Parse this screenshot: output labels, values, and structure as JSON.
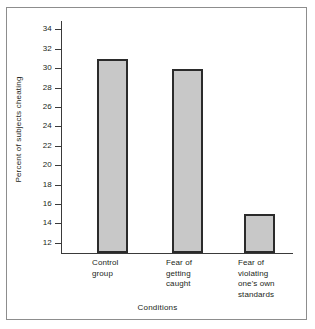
{
  "chart_data": {
    "type": "bar",
    "title": "",
    "subtitle": "",
    "xlabel": "Conditions",
    "ylabel": "Percent of subjects cheating",
    "categories": [
      "Control\ngroup",
      "Fear of\ngetting\ncaught",
      "Fear of\nviolating\none's own\nstandards"
    ],
    "values": [
      31,
      30,
      15
    ],
    "ylim": [
      11,
      34.8
    ],
    "yticks": [
      12,
      14,
      16,
      18,
      20,
      22,
      24,
      26,
      28,
      30,
      32,
      34
    ],
    "ytick_labels": [
      "12",
      "14",
      "16",
      "18",
      "20",
      "22",
      "24",
      "26",
      "28",
      "30",
      "32",
      "34"
    ],
    "grid": false,
    "legend": null,
    "bar_fill_color": "#c8c8c8",
    "bar_edge_color": "#2b2b2b",
    "axis_color": "#3a3a3a",
    "frame_color": "#8d8d8d",
    "background_color": "#ffffff"
  }
}
